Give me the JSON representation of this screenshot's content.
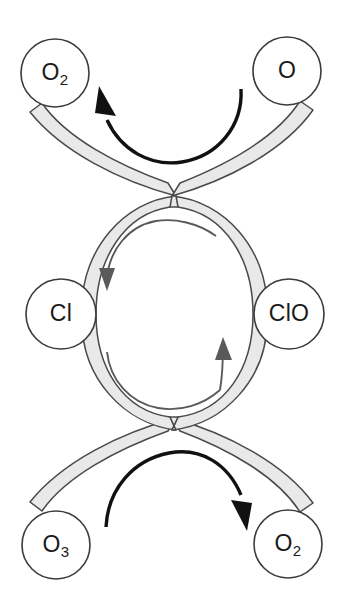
{
  "diagram": {
    "type": "cycle-diagram",
    "canvas": {
      "width": 349,
      "height": 605
    },
    "colors": {
      "background": "#ffffff",
      "ribbon_fill": "#e9e9e9",
      "ribbon_stroke": "#4a4a4a",
      "node_fill": "#ffffff",
      "node_stroke": "#3b3b3b",
      "node_text": "#1a1a1a",
      "reaction_arrow": "#111111",
      "cycle_arrow": "#5a5a5a"
    },
    "nodes": [
      {
        "id": "o2-top-left",
        "base": "O",
        "subscript": "2",
        "full_label": "O2",
        "position": "top-left",
        "cx": 55,
        "cy": 73,
        "r": 34
      },
      {
        "id": "o-top-right",
        "base": "O",
        "subscript": "",
        "full_label": "O",
        "position": "top-right",
        "cx": 287,
        "cy": 71,
        "r": 34
      },
      {
        "id": "cl-middle-left",
        "base": "Cl",
        "subscript": "",
        "full_label": "Cl",
        "position": "middle-left",
        "cx": 61,
        "cy": 314,
        "r": 35
      },
      {
        "id": "clo-middle-right",
        "base": "ClO",
        "subscript": "",
        "full_label": "ClO",
        "position": "middle-right",
        "cx": 289,
        "cy": 314,
        "r": 35
      },
      {
        "id": "o3-bottom-left",
        "base": "O",
        "subscript": "3",
        "full_label": "O3",
        "position": "bottom-left",
        "cx": 56,
        "cy": 545,
        "r": 34
      },
      {
        "id": "o2-bottom-right",
        "base": "O",
        "subscript": "2",
        "full_label": "O2",
        "position": "bottom-right",
        "cx": 288,
        "cy": 544,
        "r": 34
      }
    ],
    "reaction_arrows": [
      {
        "id": "top-reaction-arrow",
        "from_node": "o-top-right",
        "to_node": "o2-top-left",
        "direction": "right-to-left",
        "style": "thick-black-arc",
        "head_at": "left"
      },
      {
        "id": "bottom-reaction-arrow",
        "from_node": "o3-bottom-left",
        "to_node": "o2-bottom-right",
        "direction": "left-to-right",
        "style": "thick-black-arc",
        "head_at": "right"
      }
    ],
    "cycle_arrows": [
      {
        "id": "inner-arrow-left",
        "from_node": "clo-middle-right",
        "to_node": "cl-middle-left",
        "direction": "clockwise-over-top",
        "style": "thin-gray-arc",
        "head_at": "bottom-left"
      },
      {
        "id": "inner-arrow-right",
        "from_node": "cl-middle-left",
        "to_node": "clo-middle-right",
        "direction": "clockwise-under-bottom",
        "style": "thin-gray-arc",
        "head_at": "top-right"
      }
    ],
    "ribbon": {
      "id": "figure-eight-ribbon",
      "description": "Figure-eight gray band connecting all six nodes through two crossover points",
      "crossover_points": [
        {
          "x": 174,
          "y": 189
        },
        {
          "x": 174,
          "y": 425
        }
      ]
    }
  }
}
